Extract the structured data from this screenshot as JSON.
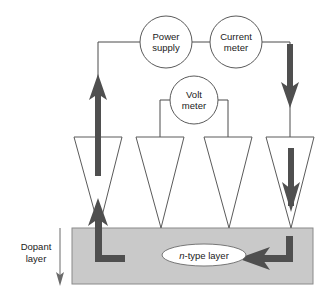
{
  "figure": {
    "instruments": [
      {
        "id": "power-supply",
        "line1": "Power",
        "line2": "supply",
        "cx": 166,
        "cy": 42,
        "r": 26
      },
      {
        "id": "current-meter",
        "line1": "Current",
        "line2": "meter",
        "cx": 236,
        "cy": 42,
        "r": 26
      },
      {
        "id": "volt-meter",
        "line1": "Volt",
        "line2": "meter",
        "cx": 194,
        "cy": 100,
        "r": 24
      }
    ],
    "labels": {
      "dopant_line1": "Dopant",
      "dopant_line2": "layer",
      "ntype_prefix": "n",
      "ntype_rest": "-type layer"
    },
    "probes": [
      {
        "id": "probe-1",
        "cx": 98,
        "role": "current-in"
      },
      {
        "id": "probe-2",
        "cx": 160,
        "role": "voltage-sense-left"
      },
      {
        "id": "probe-3",
        "cx": 228,
        "role": "voltage-sense-right"
      },
      {
        "id": "probe-4",
        "cx": 290,
        "role": "current-out"
      }
    ],
    "colors": {
      "layer": "#c9c9c9",
      "wire": "#4a4a4a",
      "flow_arrow": "#4f4f4f",
      "text": "#1a1a1a",
      "outline": "#5a5a5a"
    },
    "layer_region": {
      "x": 72,
      "y": 228,
      "width": 241,
      "height": 56
    }
  }
}
